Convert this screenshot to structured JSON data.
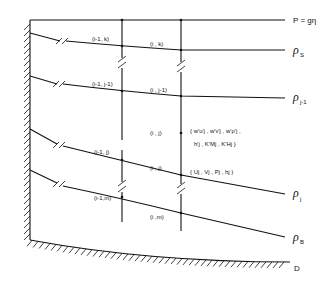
{
  "diagram": {
    "surface_label": "P = gη",
    "layers": [
      {
        "id": "s",
        "label_main": "ρ",
        "label_sub": "S",
        "left_node": "(i-1, k)",
        "right_node": "(i , k)"
      },
      {
        "id": "j-1",
        "label_main": "ρ",
        "label_sub": "j-1",
        "left_node": "(i-1, j-1)",
        "right_node": "(i , j-1)"
      },
      {
        "id": "j",
        "label_main": "ρ",
        "label_sub": "j",
        "left_node": "(i-1, j)",
        "right_node": "(i , j)"
      },
      {
        "id": "b",
        "label_main": "ρ",
        "label_sub": "B",
        "left_node": "(i-1,m)",
        "right_node": "(i ,m)"
      }
    ],
    "mid_node": "(i , j)",
    "flux_set_line1": "{ w'u'j , w'v'j , w'ρ'j ,",
    "flux_set_line2": "h'j , K'Mj , K'Hj }",
    "state_set": "{ Uj , Vj , Pj , hj }",
    "bottom_label": "D"
  }
}
